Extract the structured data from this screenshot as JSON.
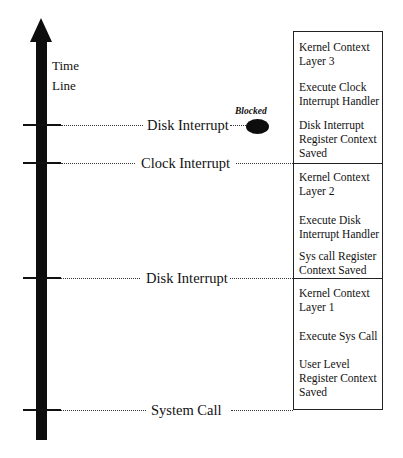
{
  "timeline": {
    "label_line1": "Time",
    "label_line2": "Line"
  },
  "events": [
    {
      "label": "Disk Interrupt",
      "y": 125
    },
    {
      "label": "Clock Interrupt",
      "y": 163
    },
    {
      "label": "Disk Interrupt",
      "y": 278
    },
    {
      "label": "System Call",
      "y": 410
    }
  ],
  "blocked": {
    "label": "Blocked"
  },
  "stack": {
    "layer3": {
      "line1": "Kernel Context",
      "line2": "Layer 3",
      "action1": "Execute Clock",
      "action2": "Interrupt Handler",
      "saved1": "Disk Interrupt",
      "saved2": "Register Context",
      "saved3": "Saved"
    },
    "layer2": {
      "line1": "Kernel Context",
      "line2": "Layer 2",
      "action1": "Execute Disk",
      "action2": "Interrupt Handler",
      "saved1": "Sys call Register",
      "saved2": "Context Saved"
    },
    "layer1": {
      "line1": "Kernel Context",
      "line2": "Layer 1",
      "action1": "Execute Sys Call",
      "saved1": "User Level",
      "saved2": "Register Context",
      "saved3": "Saved"
    }
  }
}
